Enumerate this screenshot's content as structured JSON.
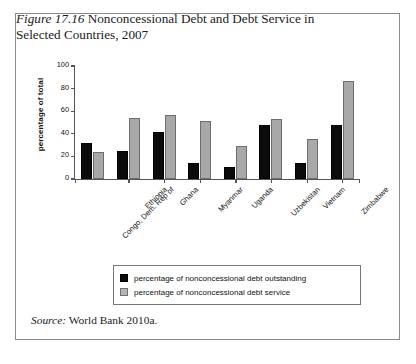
{
  "figure": {
    "number_label": "Figure 17.16",
    "title_text": "Nonconcessional Debt and Debt Service in Selected Countries, 2007",
    "source_label": "Source:",
    "source_text": "World Bank 2010a."
  },
  "legend": {
    "items": [
      {
        "label": "percentage of nonconcessional debt outstanding",
        "swatch": "black"
      },
      {
        "label": "percentage of nonconcessional debt service",
        "swatch": "gray"
      }
    ]
  },
  "chart_data": {
    "type": "bar",
    "title": "Nonconcessional Debt and Debt Service in Selected Countries, 2007",
    "xlabel": "",
    "ylabel": "percentage of total",
    "ylim": [
      0,
      100
    ],
    "yticks": [
      0,
      20,
      40,
      60,
      80,
      100
    ],
    "grid": false,
    "legend_position": "bottom",
    "categories": [
      "Congo, Dem. Rep of",
      "Ethiopia",
      "Ghana",
      "Myanmar",
      "Uganda",
      "Uzbekistan",
      "Vietnam",
      "Zimbabwe"
    ],
    "series": [
      {
        "name": "percentage of nonconcessional debt outstanding",
        "color": "#0b0b0b",
        "values": [
          32,
          25,
          42,
          14,
          11,
          48,
          14,
          48
        ]
      },
      {
        "name": "percentage of nonconcessional debt service",
        "color": "#a8a8a8",
        "values": [
          24,
          54,
          57,
          51,
          29,
          53,
          35,
          87
        ]
      }
    ]
  }
}
